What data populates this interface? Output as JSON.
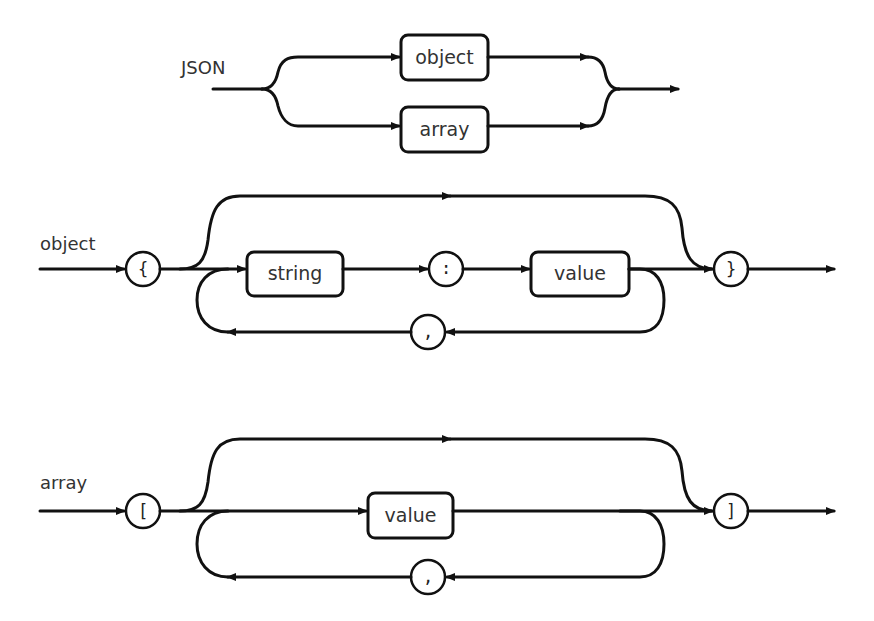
{
  "diagram": {
    "type": "railroad syntax diagram",
    "rules": [
      {
        "name": "JSON",
        "label": "JSON",
        "alternatives": [
          {
            "type": "nonterminal",
            "text": "object"
          },
          {
            "type": "nonterminal",
            "text": "array"
          }
        ]
      },
      {
        "name": "object",
        "label": "object",
        "open": "{",
        "string": "string",
        "colon": ":",
        "value": "value",
        "separator": ",",
        "close": "}"
      },
      {
        "name": "array",
        "label": "array",
        "open": "[",
        "value": "value",
        "separator": ",",
        "close": "]"
      }
    ]
  },
  "colors": {
    "stroke": "#111111",
    "text": "#333333",
    "background": "#ffffff"
  }
}
